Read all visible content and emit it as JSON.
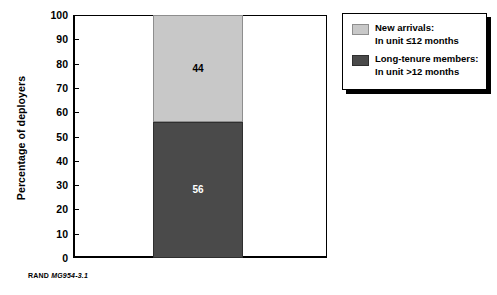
{
  "chart_data": {
    "type": "bar",
    "title": "",
    "subtitle": "",
    "xlabel": "",
    "ylabel": "Percentage of deployers",
    "ylim": [
      0,
      100
    ],
    "yticks": [
      0,
      10,
      20,
      30,
      40,
      50,
      60,
      70,
      80,
      90,
      100
    ],
    "ytick_labels": [
      "0",
      "10",
      "20",
      "30",
      "40",
      "50",
      "60",
      "70",
      "80",
      "90",
      "100"
    ],
    "grid": false,
    "stacked": true,
    "legend_position": "right",
    "categories": [
      ""
    ],
    "series": [
      {
        "name": "Long-tenure members: In unit >12 months",
        "values": [
          56
        ],
        "color": "#4a4a4a",
        "data_labels": [
          "56"
        ],
        "label_color": "#ffffff"
      },
      {
        "name": "New arrivals: In unit ≤12 months",
        "values": [
          44
        ],
        "color": "#c8c8c8",
        "data_labels": [
          "44"
        ],
        "label_color": "#000000"
      }
    ]
  },
  "legend": {
    "entries": [
      {
        "swatch_color": "#c8c8c8",
        "line1": "New arrivals:",
        "line2": "In unit ≤12 months"
      },
      {
        "swatch_color": "#4a4a4a",
        "line1": "Long-tenure members:",
        "line2": "In unit >12 months"
      }
    ]
  },
  "credit": {
    "organization": "RAND",
    "figure_code": "MG954-3.1"
  },
  "axis": {
    "y_title": "Percentage of deployers",
    "tick_labels": [
      "100",
      "90",
      "80",
      "70",
      "60",
      "50",
      "40",
      "30",
      "20",
      "10",
      "0"
    ]
  }
}
